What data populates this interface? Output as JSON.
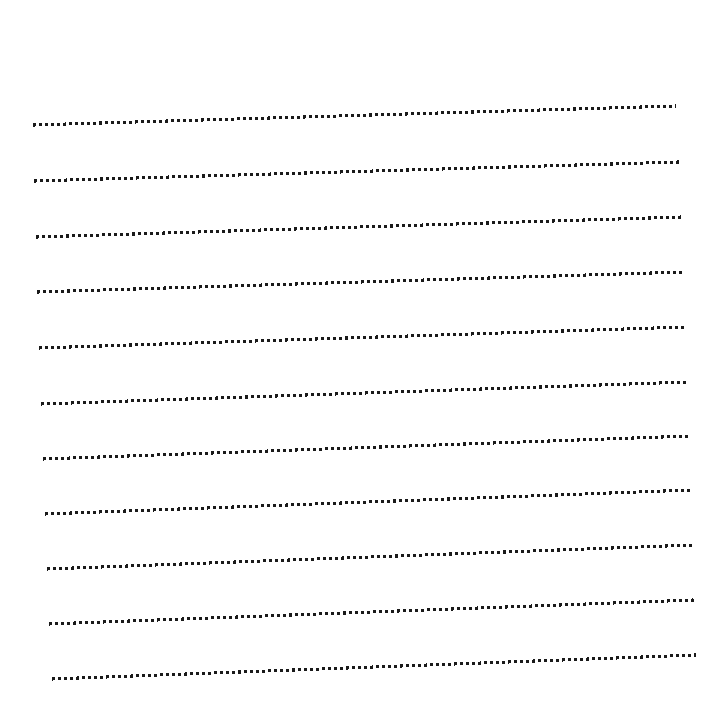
{
  "page": {
    "title": "Dotted Ruled Lines Sheet",
    "width": 723,
    "height": 725,
    "background_color": "#ffffff"
  },
  "style": {
    "dot_color": "#1a1a1a",
    "dot_size_px": 3,
    "dot_gap_px": 3,
    "dash_pattern": "3 3",
    "stroke_width_px": 3.1,
    "line_count": 11,
    "line_spacing_px": 56
  },
  "chart_data": {
    "type": "line",
    "title": "Dotted Ruled Lines Sheet",
    "subtitle": "",
    "xlabel": "",
    "ylabel": "",
    "xlim": [
      0,
      723
    ],
    "ylim": [
      725,
      0
    ],
    "grid": false,
    "legend": "none",
    "annotations": [],
    "series": [
      {
        "name": "ruled-line-1",
        "index": 1,
        "x": [
          33,
          676
        ],
        "y": [
          125,
          106
        ],
        "x_start": 33,
        "y_start": 125,
        "x_end": 676,
        "y_end": 106,
        "length_px": 643,
        "rise_px": -19
      },
      {
        "name": "ruled-line-2",
        "index": 2,
        "x": [
          34,
          679
        ],
        "y": [
          181,
          162
        ],
        "x_start": 34,
        "y_start": 181,
        "x_end": 679,
        "y_end": 162,
        "length_px": 645,
        "rise_px": -19
      },
      {
        "name": "ruled-line-3",
        "index": 3,
        "x": [
          36,
          682
        ],
        "y": [
          237,
          217
        ],
        "x_start": 36,
        "y_start": 237,
        "x_end": 682,
        "y_end": 217,
        "length_px": 646,
        "rise_px": -20
      },
      {
        "name": "ruled-line-4",
        "index": 4,
        "x": [
          37,
          684
        ],
        "y": [
          292,
          272
        ],
        "x_start": 37,
        "y_start": 292,
        "x_end": 684,
        "y_end": 272,
        "length_px": 647,
        "rise_px": -20
      },
      {
        "name": "ruled-line-5",
        "index": 5,
        "x": [
          39,
          686
        ],
        "y": [
          348,
          327
        ],
        "x_start": 39,
        "y_start": 348,
        "x_end": 686,
        "y_end": 327,
        "length_px": 647,
        "rise_px": -21
      },
      {
        "name": "ruled-line-6",
        "index": 6,
        "x": [
          41,
          688
        ],
        "y": [
          404,
          382
        ],
        "x_start": 41,
        "y_start": 404,
        "x_end": 688,
        "y_end": 382,
        "length_px": 647,
        "rise_px": -22
      },
      {
        "name": "ruled-line-7",
        "index": 7,
        "x": [
          43,
          690
        ],
        "y": [
          459,
          436
        ],
        "x_start": 43,
        "y_start": 459,
        "x_end": 690,
        "y_end": 436,
        "length_px": 647,
        "rise_px": -23
      },
      {
        "name": "ruled-line-8",
        "index": 8,
        "x": [
          45,
          691
        ],
        "y": [
          514,
          490
        ],
        "x_start": 45,
        "y_start": 514,
        "x_end": 691,
        "y_end": 490,
        "length_px": 646,
        "rise_px": -24
      },
      {
        "name": "ruled-line-9",
        "index": 9,
        "x": [
          47,
          693
        ],
        "y": [
          569,
          545
        ],
        "x_start": 47,
        "y_start": 569,
        "x_end": 693,
        "y_end": 545,
        "length_px": 646,
        "rise_px": -24
      },
      {
        "name": "ruled-line-10",
        "index": 10,
        "x": [
          49,
          694
        ],
        "y": [
          624,
          600
        ],
        "x_start": 49,
        "y_start": 624,
        "x_end": 694,
        "y_end": 600,
        "length_px": 645,
        "rise_px": -24
      },
      {
        "name": "ruled-line-11",
        "index": 11,
        "x": [
          52,
          696
        ],
        "y": [
          679,
          655
        ],
        "x_start": 52,
        "y_start": 679,
        "x_end": 696,
        "y_end": 655,
        "length_px": 644,
        "rise_px": -24
      }
    ]
  }
}
